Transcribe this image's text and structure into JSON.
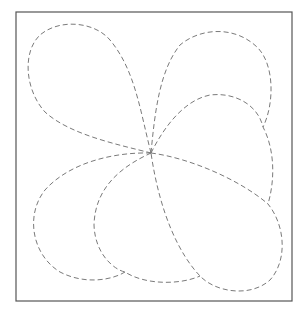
{
  "diagram": {
    "background_color": "#ffffff",
    "frame": {
      "x": 16,
      "y": 12,
      "width": 276,
      "height": 289,
      "stroke_color": "#555555",
      "stroke_width": 1.2
    },
    "center": {
      "x": 151,
      "y": 153
    },
    "petal_style": {
      "stroke_color": "#7a7a7a",
      "stroke_width": 1,
      "dash_pattern": "5 3"
    },
    "petals": [
      {
        "id": "top-left",
        "d": "M151,153 C140,110 135,70 110,40 C95,22 60,18 40,35 C22,52 25,90 45,112 C70,135 120,145 151,153 Z"
      },
      {
        "id": "top-right",
        "d": "M151,153 C155,110 160,70 180,45 C200,28 235,25 258,48 C275,66 274,105 263,127"
      },
      {
        "id": "middle-right",
        "d": "M151,153 C165,125 185,100 210,95 C235,92 258,105 263,127 C275,150 275,180 268,204"
      },
      {
        "id": "bottom-right",
        "d": "M151,153 C190,158 240,180 268,204 C285,225 288,260 270,280 C250,298 215,292 200,276 C180,255 160,215 151,153 Z"
      },
      {
        "id": "bottom-center",
        "d": "M151,153 C125,165 95,185 94,225 C95,255 115,270 125,272 C145,285 180,285 200,276"
      },
      {
        "id": "bottom-left",
        "d": "M151,153 C115,152 70,162 45,190 C25,215 32,255 60,272 C85,285 112,280 125,272"
      }
    ]
  }
}
